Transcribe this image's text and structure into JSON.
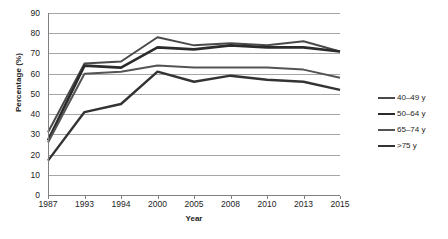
{
  "chart_data": {
    "type": "line",
    "title": "",
    "xlabel": "Year",
    "ylabel": "Percentage (%)",
    "categories": [
      "1987",
      "1993",
      "1994",
      "2000",
      "2005",
      "2008",
      "2010",
      "2013",
      "2015"
    ],
    "ylim": [
      0,
      90
    ],
    "ytick_step": 10,
    "yticks": [
      "90",
      "80",
      "70",
      "60",
      "50",
      "40",
      "30",
      "20",
      "10",
      "0"
    ],
    "grid": "horizontal",
    "legend_position": "right",
    "series": [
      {
        "name": "40–49 y",
        "color": "#4a4a4a",
        "width": 2.0,
        "values": [
          31,
          65,
          66,
          78,
          74,
          75,
          74,
          76,
          71
        ]
      },
      {
        "name": "50–64 y",
        "color": "#2b2b2b",
        "width": 2.6,
        "values": [
          27,
          64,
          63,
          73,
          72,
          74,
          73,
          73,
          71
        ]
      },
      {
        "name": "65–74 y",
        "color": "#545454",
        "width": 2.0,
        "values": [
          26,
          60,
          61,
          64,
          63,
          63,
          63,
          62,
          58
        ]
      },
      {
        "name": ">75 y",
        "color": "#333333",
        "width": 2.4,
        "values": [
          17,
          41,
          45,
          61,
          56,
          59,
          57,
          56,
          52
        ]
      }
    ]
  },
  "axes": {
    "grid_color": "#a6a6a6",
    "axis_color": "#808080",
    "plot_background": "#ffffff"
  }
}
